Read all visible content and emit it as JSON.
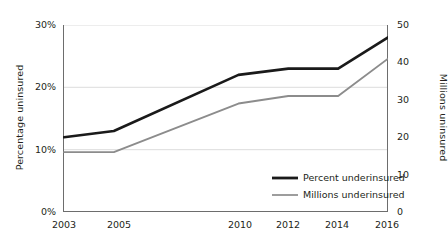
{
  "chart_data": {
    "type": "line",
    "title": "",
    "xlabel": "",
    "categories": [
      "2003",
      "2005",
      "2010",
      "2012",
      "2014",
      "2016"
    ],
    "x": [
      2003,
      2005,
      2010,
      2012,
      2014,
      2016
    ],
    "grid": true,
    "legend_position": "inside-bottom-right",
    "series": [
      {
        "name": "Percent underinsured",
        "axis": "left",
        "color": "#1a1a1a",
        "line_width": 2.6,
        "values": [
          12,
          13,
          22,
          23,
          23,
          28
        ],
        "unit": "%"
      },
      {
        "name": "Millions underinsured",
        "axis": "right",
        "color": "#8c8c8c",
        "line_width": 1.9,
        "values": [
          16,
          16,
          29,
          31,
          31,
          41
        ],
        "unit": "million"
      }
    ],
    "axes": {
      "left": {
        "label": "Percentage uninsured",
        "ticks": [
          "0%",
          "10%",
          "20%",
          "30%"
        ],
        "tick_values": [
          0,
          10,
          20,
          30
        ],
        "ylim": [
          0,
          30
        ]
      },
      "right": {
        "label": "Millions uninsured",
        "ticks": [
          "0",
          "10",
          "20",
          "30",
          "40",
          "50"
        ],
        "tick_values": [
          0,
          10,
          20,
          30,
          40,
          50
        ],
        "ylim": [
          0,
          50
        ]
      }
    },
    "gridline_values_left": [
      10,
      20,
      30
    ]
  },
  "legend": {
    "items": [
      {
        "label": "Percent underinsured",
        "color": "#1a1a1a",
        "width": 2.8
      },
      {
        "label": "Millions underinsured",
        "color": "#8c8c8c",
        "width": 1.7
      }
    ]
  },
  "colors": {
    "axis": "#6d6d6d",
    "grid": "#dcdcdc",
    "text": "#231f20",
    "series_primary": "#1a1a1a",
    "series_secondary": "#8c8c8c"
  }
}
